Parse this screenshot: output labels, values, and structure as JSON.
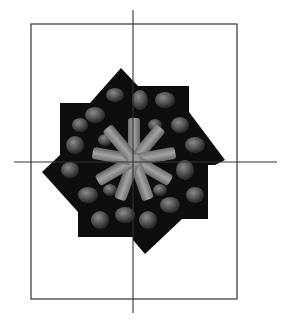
{
  "figure": {
    "caption_fragment": "",
    "colors": {
      "frame": "#333333",
      "axis": "#333333",
      "image_dark": "#0d0d0d",
      "petal": "#9a9a9a",
      "cell": "#4a4a4a"
    },
    "frame_rect": {
      "x": 31,
      "y": 24,
      "w": 206,
      "h": 275
    },
    "axes": {
      "vertical": {
        "x": 133,
        "y1": 10,
        "y2": 313
      },
      "horizontal": {
        "y": 162,
        "x1": 14,
        "x2": 277
      }
    }
  }
}
